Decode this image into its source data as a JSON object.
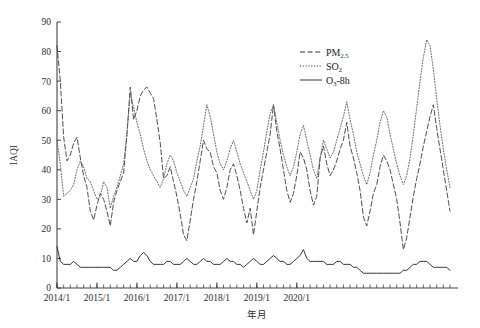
{
  "chart_data": {
    "type": "line",
    "title": "",
    "xlabel": "年月",
    "ylabel": "IAQI",
    "ylim": [
      0,
      90
    ],
    "ytick_step": 10,
    "yticks": [
      "0",
      "10",
      "20",
      "30",
      "40",
      "50",
      "60",
      "70",
      "80",
      "90"
    ],
    "xticks": [
      "2014/1",
      "2015/1",
      "2016/1",
      "2017/1",
      "2018/1",
      "2019/1",
      "2020/1"
    ],
    "x_minor_ticks_per_year": 12,
    "grid": false,
    "legend_position": "top-right",
    "x_start": "2014/1",
    "x_end": "2020/3",
    "series": [
      {
        "name": "PM2.5",
        "label": "PM",
        "label_sub": "2.5",
        "style": "dashed",
        "color": "#3a3a3a",
        "values": [
          82,
          70,
          51,
          43,
          45,
          49,
          51,
          44,
          38,
          34,
          26,
          23,
          28,
          32,
          30,
          26,
          21,
          29,
          33,
          36,
          39,
          52,
          68,
          57,
          60,
          65,
          67,
          68,
          66,
          64,
          57,
          49,
          37,
          38,
          41,
          36,
          31,
          25,
          18,
          16,
          23,
          30,
          36,
          43,
          50,
          47,
          46,
          41,
          39,
          33,
          30,
          34,
          40,
          42,
          38,
          33,
          27,
          22,
          27,
          18,
          26,
          34,
          40,
          46,
          52,
          62,
          53,
          47,
          40,
          33,
          29,
          32,
          38,
          46,
          44,
          40,
          33,
          28,
          31,
          44,
          48,
          42,
          38,
          40,
          43,
          47,
          50,
          56,
          48,
          44,
          39,
          33,
          24,
          21,
          26,
          32,
          35,
          41,
          45,
          43,
          40,
          35,
          30,
          22,
          13,
          17,
          24,
          31,
          37,
          42,
          48,
          53,
          58,
          62,
          54,
          47,
          40,
          33,
          26
        ]
      },
      {
        "name": "SO2",
        "label": "SO",
        "label_sub": "2",
        "style": "dotted",
        "color": "#5a5a5a",
        "values": [
          50,
          42,
          31,
          32,
          33,
          35,
          40,
          43,
          41,
          37,
          36,
          33,
          30,
          31,
          36,
          34,
          27,
          31,
          34,
          38,
          42,
          52,
          66,
          61,
          56,
          52,
          47,
          43,
          40,
          38,
          36,
          34,
          37,
          42,
          45,
          43,
          39,
          36,
          33,
          31,
          34,
          37,
          43,
          48,
          55,
          62,
          58,
          52,
          46,
          42,
          40,
          43,
          47,
          50,
          46,
          42,
          39,
          36,
          33,
          30,
          33,
          40,
          46,
          53,
          59,
          62,
          56,
          50,
          45,
          41,
          38,
          41,
          46,
          52,
          55,
          50,
          45,
          40,
          37,
          44,
          50,
          47,
          44,
          46,
          50,
          54,
          58,
          63,
          57,
          52,
          46,
          42,
          38,
          35,
          39,
          45,
          50,
          56,
          60,
          58,
          52,
          47,
          42,
          38,
          35,
          38,
          44,
          52,
          61,
          70,
          78,
          84,
          82,
          74,
          64,
          55,
          47,
          40,
          34
        ]
      },
      {
        "name": "O3-8h",
        "label": "O",
        "label_sub": "3",
        "label_tail": "-8h",
        "style": "solid",
        "color": "#2a2a2a",
        "values": [
          14,
          9,
          8,
          8,
          8,
          9,
          8,
          7,
          7,
          7,
          7,
          7,
          7,
          7,
          7,
          7,
          7,
          6,
          6,
          7,
          8,
          9,
          10,
          9,
          9,
          11,
          12,
          11,
          9,
          8,
          8,
          8,
          8,
          9,
          9,
          8,
          8,
          8,
          9,
          10,
          9,
          8,
          8,
          9,
          10,
          9,
          9,
          8,
          8,
          8,
          9,
          10,
          9,
          9,
          8,
          8,
          7,
          8,
          9,
          10,
          9,
          8,
          8,
          9,
          10,
          11,
          10,
          9,
          9,
          8,
          8,
          9,
          10,
          11,
          13,
          10,
          9,
          9,
          9,
          9,
          9,
          8,
          8,
          8,
          9,
          9,
          8,
          8,
          8,
          7,
          7,
          6,
          5,
          5,
          5,
          5,
          5,
          5,
          5,
          5,
          5,
          5,
          5,
          5,
          6,
          6,
          7,
          8,
          8,
          9,
          9,
          9,
          8,
          7,
          7,
          7,
          7,
          7,
          6
        ]
      }
    ]
  },
  "legend": {
    "items": [
      {
        "name": "PM2.5",
        "label": "PM",
        "sub": "2.5",
        "tail": "",
        "style": "dashed"
      },
      {
        "name": "SO2",
        "label": "SO",
        "sub": "2",
        "tail": "",
        "style": "dotted"
      },
      {
        "name": "O3-8h",
        "label": "O",
        "sub": "3",
        "tail": "-8h",
        "style": "solid"
      }
    ]
  }
}
